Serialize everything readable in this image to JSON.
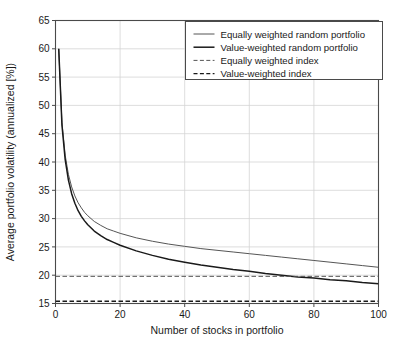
{
  "chart_data": {
    "type": "line",
    "title": "",
    "xlabel": "Number of stocks in portfolio",
    "ylabel": "Average portfolio volatility (annualized [%])",
    "xlim": [
      0,
      100
    ],
    "ylim": [
      15,
      65
    ],
    "xticks": [
      0,
      20,
      40,
      60,
      80,
      100
    ],
    "yticks": [
      15,
      20,
      25,
      30,
      35,
      40,
      45,
      50,
      55,
      60,
      65
    ],
    "xtick_labels": [
      "0",
      "20",
      "40",
      "60",
      "80",
      "100"
    ],
    "ytick_labels": [
      "15",
      "20",
      "25",
      "30",
      "35",
      "40",
      "45",
      "50",
      "55",
      "60",
      "65"
    ],
    "grid": true,
    "legend_position": "top-right",
    "series": [
      {
        "name": "Equally weighted random portfolio",
        "style": "solid",
        "color": "#555555",
        "width": 1.0,
        "x": [
          1,
          2,
          3,
          4,
          5,
          6,
          7,
          8,
          9,
          10,
          12,
          14,
          16,
          18,
          20,
          25,
          30,
          35,
          40,
          45,
          50,
          55,
          60,
          65,
          70,
          75,
          80,
          85,
          90,
          95,
          100
        ],
        "y": [
          60.0,
          47.0,
          41.2,
          37.8,
          35.6,
          34.0,
          32.8,
          31.9,
          31.1,
          30.5,
          29.5,
          28.8,
          28.2,
          27.8,
          27.4,
          26.6,
          26.0,
          25.5,
          25.1,
          24.7,
          24.4,
          24.1,
          23.8,
          23.5,
          23.2,
          22.9,
          22.6,
          22.3,
          22.0,
          21.7,
          21.4
        ]
      },
      {
        "name": "Value-weighted random portfolio",
        "style": "solid",
        "color": "#1a1a1a",
        "width": 1.5,
        "x": [
          1,
          2,
          3,
          4,
          5,
          6,
          7,
          8,
          9,
          10,
          12,
          14,
          16,
          18,
          20,
          25,
          30,
          35,
          40,
          45,
          50,
          55,
          60,
          65,
          70,
          75,
          80,
          85,
          90,
          95,
          100
        ],
        "y": [
          60.0,
          46.5,
          40.4,
          36.8,
          34.4,
          32.7,
          31.4,
          30.4,
          29.6,
          28.9,
          27.8,
          27.0,
          26.3,
          25.8,
          25.3,
          24.3,
          23.5,
          22.8,
          22.3,
          21.8,
          21.4,
          21.0,
          20.7,
          20.3,
          20.0,
          19.7,
          19.5,
          19.2,
          19.0,
          18.7,
          18.5
        ]
      },
      {
        "name": "Equally weighted index",
        "style": "dashed",
        "color": "#555555",
        "width": 1.0,
        "constant": 19.8
      },
      {
        "name": "Value-weighted index",
        "style": "dashed",
        "color": "#1a1a1a",
        "width": 1.3,
        "constant": 15.4
      }
    ]
  },
  "legend": {
    "items": [
      {
        "label": "Equally weighted random portfolio"
      },
      {
        "label": "Value-weighted random portfolio"
      },
      {
        "label": "Equally weighted index"
      },
      {
        "label": "Value-weighted index"
      }
    ]
  },
  "axes": {
    "x_title": "Number of stocks in portfolio",
    "y_title": "Average portfolio volatility (annualized [%])"
  },
  "colors": {
    "background": "#ffffff",
    "grid": "#d4d4d4",
    "frame": "#4a4a4a",
    "series_light": "#555555",
    "series_dark": "#1a1a1a"
  }
}
